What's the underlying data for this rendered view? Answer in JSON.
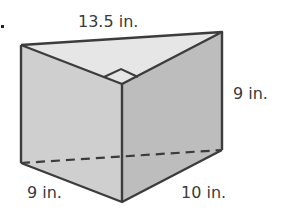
{
  "diagram": {
    "type": "triangular-prism",
    "labels": {
      "top_edge": "13.5 in.",
      "height": "9 in.",
      "bottom_left_edge": "9 in.",
      "bottom_right_edge": "10 in."
    },
    "marker": "."
  },
  "colors": {
    "background": "#ffffff",
    "edge": "#3c3c3c",
    "top_face": "#e6e6e6",
    "left_face": "#cfcfcf",
    "right_face": "#bdbdbd",
    "text": "#3a3a3a"
  }
}
